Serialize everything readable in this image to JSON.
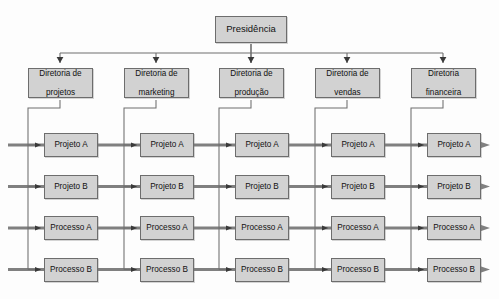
{
  "diagram": {
    "title_node": {
      "label": "Presidência"
    },
    "type": "matrix-organizational-chart",
    "colors": {
      "node_fill": "#d2d2d2",
      "node_border": "#6d6d6d",
      "flow_line": "#808080",
      "branch_line": "#6f6f6f",
      "background": "#fdfdfd",
      "text": "#111111"
    },
    "directorates": [
      {
        "label": "Diretoria de projetos",
        "line1": "Diretoria de",
        "line2": "projetos"
      },
      {
        "label": "Diretoria de marketing",
        "line1": "Diretoria de",
        "line2": "marketing"
      },
      {
        "label": "Diretoria de produção",
        "line1": "Diretoria de",
        "line2": "produção"
      },
      {
        "label": "Diretoria de vendas",
        "line1": "Diretoria de",
        "line2": "vendas"
      },
      {
        "label": "Diretoria financeira",
        "line1": "Diretoria",
        "line2": "financeira"
      }
    ],
    "rows": [
      {
        "label": "Projeto A",
        "cells": [
          "Projeto A",
          "Projeto A",
          "Projeto A",
          "Projeto A",
          "Projeto A"
        ]
      },
      {
        "label": "Projeto B",
        "cells": [
          "Projeto B",
          "Projeto B",
          "Projeto B",
          "Projeto B",
          "Projeto B"
        ]
      },
      {
        "label": "Processo A",
        "cells": [
          "Processo A",
          "Processo A",
          "Processo A",
          "Processo A",
          "Processo A"
        ]
      },
      {
        "label": "Processo B",
        "cells": [
          "Processo B",
          "Processo B",
          "Processo B",
          "Processo B",
          "Processo B"
        ]
      }
    ]
  }
}
